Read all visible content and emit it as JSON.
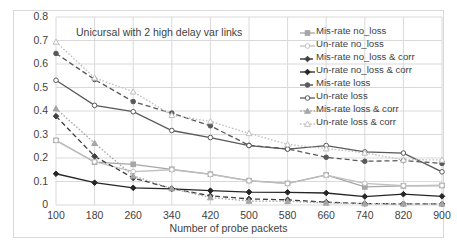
{
  "chart_data": {
    "type": "line",
    "title": "Unicursal with 2 high delay var links",
    "xlabel": "Number of probe packets",
    "ylabel": "",
    "grid": true,
    "legend_position": "right-inside-top",
    "x": [
      100,
      180,
      260,
      340,
      420,
      500,
      580,
      660,
      740,
      820,
      900
    ],
    "xlim": [
      100,
      900
    ],
    "ylim": [
      0,
      0.8
    ],
    "ytick_labels": [
      "0",
      "0.1",
      "0.2",
      "0.3",
      "0.4",
      "0.5",
      "0.6",
      "0.7",
      "0.8"
    ],
    "ytick_values": [
      0,
      0.1,
      0.2,
      0.3,
      0.4,
      0.5,
      0.6,
      0.7,
      0.8
    ],
    "xtick_labels": [
      "100",
      "180",
      "260",
      "340",
      "420",
      "500",
      "580",
      "660",
      "740",
      "820",
      "900"
    ],
    "series": [
      {
        "name": "Mis-rate no_loss",
        "color": "#a6a6a6",
        "dash": "solid",
        "marker": "square",
        "marker_filled": true,
        "values": [
          0.275,
          0.182,
          0.173,
          0.152,
          0.131,
          0.104,
          0.092,
          0.128,
          0.077,
          0.081,
          0.083
        ]
      },
      {
        "name": "Un-rate no_loss",
        "color": "#bfbfbf",
        "dash": "solid",
        "marker": "circle",
        "marker_filled": false,
        "values": [
          0.275,
          0.184,
          0.142,
          0.15,
          0.13,
          0.103,
          0.091,
          0.127,
          0.092,
          0.082,
          0.083
        ]
      },
      {
        "name": "Mis-rate no_loss & corr",
        "color": "#404040",
        "dash": "dashed",
        "marker": "diamond",
        "marker_filled": true,
        "values": [
          0.378,
          0.207,
          0.115,
          0.07,
          0.039,
          0.026,
          0.022,
          0.012,
          0.006,
          0.005,
          0.005
        ]
      },
      {
        "name": "Un-rate no_loss & corr",
        "color": "#262626",
        "dash": "solid",
        "marker": "diamond",
        "marker_filled": true,
        "values": [
          0.133,
          0.095,
          0.073,
          0.069,
          0.061,
          0.055,
          0.054,
          0.051,
          0.036,
          0.046,
          0.037
        ]
      },
      {
        "name": "Mis-rate loss",
        "color": "#595959",
        "dash": "dashed",
        "marker": "circle",
        "marker_filled": true,
        "values": [
          0.645,
          0.534,
          0.44,
          0.391,
          0.337,
          0.254,
          0.239,
          0.203,
          0.186,
          0.189,
          0.177
        ]
      },
      {
        "name": "Un-rate loss",
        "color": "#595959",
        "dash": "solid",
        "marker": "circle",
        "marker_filled": false,
        "values": [
          0.531,
          0.424,
          0.397,
          0.317,
          0.287,
          0.253,
          0.238,
          0.253,
          0.226,
          0.221,
          0.141
        ]
      },
      {
        "name": "Mis-rate loss & corr",
        "color": "#a6a6a6",
        "dash": "dotted",
        "marker": "triangle",
        "marker_filled": true,
        "values": [
          0.41,
          0.263,
          0.124,
          0.07,
          0.032,
          0.017,
          0.016,
          0.009,
          0.006,
          0.005,
          0.005
        ]
      },
      {
        "name": "Un-rate loss & corr",
        "color": "#bfbfbf",
        "dash": "dotted",
        "marker": "triangle",
        "marker_filled": false,
        "values": [
          0.694,
          0.541,
          0.482,
          0.382,
          0.356,
          0.305,
          0.258,
          0.24,
          0.222,
          0.192,
          0.192
        ]
      }
    ]
  },
  "axis_color": "#d9d9d9",
  "text_color": "#3f3f3f"
}
